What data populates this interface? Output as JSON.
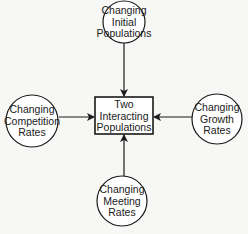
{
  "diagram": {
    "center_box": {
      "lines": [
        "Two",
        "Interacting",
        "Populations"
      ]
    },
    "nodes": [
      {
        "id": "top",
        "lines": [
          "Changing",
          "Initial",
          "Populations"
        ]
      },
      {
        "id": "left",
        "lines": [
          "Changing",
          "Competition",
          "Rates"
        ]
      },
      {
        "id": "right",
        "lines": [
          "Changing",
          "Growth",
          "Rates"
        ]
      },
      {
        "id": "bottom",
        "lines": [
          "Changing",
          "Meeting",
          "Rates"
        ]
      }
    ],
    "edges": [
      {
        "from": "top",
        "to": "center_box"
      },
      {
        "from": "left",
        "to": "center_box"
      },
      {
        "from": "right",
        "to": "center_box"
      },
      {
        "from": "bottom",
        "to": "center_box"
      }
    ],
    "colors": {
      "stroke": "#1a1a1a",
      "background": "#f7f7f5",
      "fill": "#ffffff"
    }
  }
}
